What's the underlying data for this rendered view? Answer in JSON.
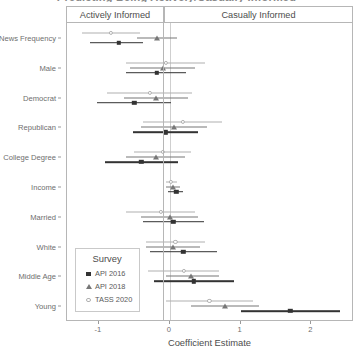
{
  "chart_data": {
    "type": "scatter",
    "title": "Predicting Being Actively/Casually Informed",
    "xlabel": "Coefficient Estimate",
    "ylabel": "",
    "xlim": [
      -1.45,
      2.6
    ],
    "xticks": [
      -1,
      0,
      1,
      2
    ],
    "xticklabels": [
      "-1",
      "0",
      "1",
      "2"
    ],
    "grid": false,
    "zero_reference_line": 0,
    "facets": [
      "Actively Informed",
      "Casually Informed"
    ],
    "categories": [
      "News Frequency",
      "Male",
      "Democrat",
      "Republican",
      "College Degree",
      "Income",
      "Married",
      "White",
      "Middle Age",
      "Young"
    ],
    "legend": {
      "title": "Survey",
      "position": "bottom-left-inside",
      "entries": [
        {
          "name": "API 2016",
          "marker": "filled-square",
          "color": "#333333"
        },
        {
          "name": "API 2018",
          "marker": "triangle",
          "color": "#777777"
        },
        {
          "name": "TASS 2020",
          "marker": "open-circle",
          "color": "#b0b0b0"
        }
      ]
    },
    "series": [
      {
        "name": "API 2016",
        "marker": "filled-square",
        "points": [
          {
            "category": "News Frequency",
            "estimate": -0.72,
            "low": -1.12,
            "high": -0.38
          },
          {
            "category": "Male",
            "estimate": -0.18,
            "low": -0.62,
            "high": 0.23
          },
          {
            "category": "Democrat",
            "estimate": -0.5,
            "low": -1.03,
            "high": 0.02
          },
          {
            "category": "Republican",
            "estimate": -0.06,
            "low": -0.52,
            "high": 0.4
          },
          {
            "category": "College Degree",
            "estimate": -0.4,
            "low": -0.92,
            "high": 0.12
          },
          {
            "category": "Income",
            "estimate": 0.09,
            "low": -0.02,
            "high": 0.19
          },
          {
            "category": "Married",
            "estimate": 0.05,
            "low": -0.38,
            "high": 0.49
          },
          {
            "category": "White",
            "estimate": 0.19,
            "low": -0.28,
            "high": 0.66
          },
          {
            "category": "Middle Age",
            "estimate": 0.34,
            "low": -0.22,
            "high": 0.9
          },
          {
            "category": "Young",
            "estimate": 1.7,
            "low": 1.0,
            "high": 2.4
          }
        ]
      },
      {
        "name": "API 2018",
        "marker": "triangle",
        "points": [
          {
            "category": "News Frequency",
            "estimate": -0.18,
            "low": -0.46,
            "high": 0.1
          },
          {
            "category": "Male",
            "estimate": -0.1,
            "low": -0.56,
            "high": 0.36
          },
          {
            "category": "Democrat",
            "estimate": -0.19,
            "low": -0.64,
            "high": 0.26
          },
          {
            "category": "Republican",
            "estimate": 0.06,
            "low": -0.4,
            "high": 0.52
          },
          {
            "category": "College Degree",
            "estimate": -0.2,
            "low": -0.62,
            "high": 0.22
          },
          {
            "category": "Income",
            "estimate": 0.05,
            "low": -0.05,
            "high": 0.14
          },
          {
            "category": "Married",
            "estimate": 0.0,
            "low": -0.4,
            "high": 0.4
          },
          {
            "category": "White",
            "estimate": 0.04,
            "low": -0.33,
            "high": 0.42
          },
          {
            "category": "Middle Age",
            "estimate": 0.3,
            "low": -0.06,
            "high": 0.7
          },
          {
            "category": "Young",
            "estimate": 0.78,
            "low": 0.3,
            "high": 1.26
          }
        ]
      },
      {
        "name": "TASS 2020",
        "marker": "open-circle",
        "points": [
          {
            "category": "News Frequency",
            "estimate": -0.83,
            "low": -1.24,
            "high": -0.42
          },
          {
            "category": "Male",
            "estimate": -0.06,
            "low": -0.62,
            "high": 0.5
          },
          {
            "category": "Democrat",
            "estimate": -0.28,
            "low": -0.88,
            "high": 0.32
          },
          {
            "category": "Republican",
            "estimate": 0.18,
            "low": -0.38,
            "high": 0.74
          },
          {
            "category": "College Degree",
            "estimate": -0.1,
            "low": -0.5,
            "high": 0.3
          },
          {
            "category": "Income",
            "estimate": 0.02,
            "low": -0.06,
            "high": 0.1
          },
          {
            "category": "Married",
            "estimate": -0.13,
            "low": -0.62,
            "high": 0.36
          },
          {
            "category": "White",
            "estimate": 0.08,
            "low": -0.34,
            "high": 0.5
          },
          {
            "category": "Middle Age",
            "estimate": 0.2,
            "low": -0.3,
            "high": 0.7
          },
          {
            "category": "Young",
            "estimate": 0.56,
            "low": -0.05,
            "high": 1.18
          }
        ]
      }
    ]
  }
}
